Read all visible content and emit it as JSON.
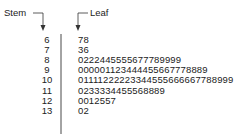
{
  "chart_data": {
    "type": "table",
    "subtype": "stem-and-leaf",
    "title": "",
    "header_labels": {
      "stem": "Stem",
      "leaf": "Leaf"
    },
    "rows": [
      {
        "stem": "6",
        "leaves": "78"
      },
      {
        "stem": "7",
        "leaves": "36"
      },
      {
        "stem": "8",
        "leaves": "0222445555677789999"
      },
      {
        "stem": "9",
        "leaves": "000001123444455667778889"
      },
      {
        "stem": "10",
        "leaves": "01111222223344555666667788999"
      },
      {
        "stem": "11",
        "leaves": "0233334455568889"
      },
      {
        "stem": "12",
        "leaves": "0012557"
      },
      {
        "stem": "13",
        "leaves": "02"
      }
    ]
  },
  "colors": {
    "text": "#222222",
    "lines": "#333333",
    "background": "#ffffff"
  }
}
